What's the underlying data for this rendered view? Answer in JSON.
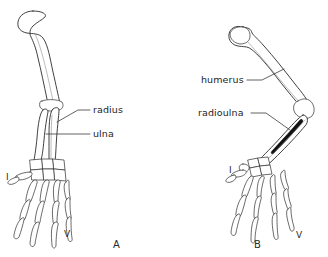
{
  "figure": {
    "background_color": "#ffffff",
    "stroke_color": "#2b2b2b",
    "width": 328,
    "height": 257
  },
  "panels": [
    {
      "id": "A",
      "letter": "A",
      "letter_x": 113,
      "letter_y": 239,
      "digit_first": "I",
      "digit_first_x": 6,
      "digit_first_y": 172,
      "digit_fifth": "V",
      "digit_fifth_x": 64,
      "digit_fifth_y": 229,
      "labels": [
        {
          "name": "radius",
          "text": "radius",
          "x": 93,
          "y": 104,
          "leader": "M 90 110 L 78 110 L 57 122"
        },
        {
          "name": "ulna",
          "text": "ulna",
          "x": 93,
          "y": 128,
          "leader": "M 90 134 L 46 134"
        }
      ]
    },
    {
      "id": "B",
      "letter": "B",
      "letter_x": 254,
      "letter_y": 239,
      "digit_first": "I",
      "digit_first_x": 229,
      "digit_first_y": 165,
      "digit_fifth": "V",
      "digit_fifth_x": 296,
      "digit_fifth_y": 230,
      "labels": [
        {
          "name": "humerus",
          "text": "humerus",
          "x": 201,
          "y": 74,
          "leader": "M 247 80 L 262 80 L 284 69"
        },
        {
          "name": "radioulna",
          "text": "radioulna",
          "x": 198,
          "y": 107,
          "leader": "M 251 113 L 266 113 L 290 130"
        }
      ]
    }
  ],
  "bone_names": {
    "humerus": "humerus",
    "radius": "radius",
    "ulna": "ulna",
    "radioulna": "radioulna",
    "carpals": "carpals",
    "metacarpals": "metacarpals",
    "phalanges": "phalanges"
  }
}
